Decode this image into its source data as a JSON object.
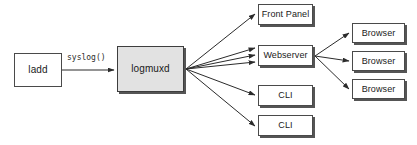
{
  "diagram": {
    "canvas": {
      "width": 417,
      "height": 145,
      "background": "#ffffff"
    },
    "colors": {
      "box_fill": "#ffffff",
      "box_fill_emphasis": "#e2e2e2",
      "box_stroke": "#4a4a4a",
      "shadow": "#555555",
      "edge_stroke": "#2b2b2b",
      "text": "#1a1a1a"
    },
    "nodes": [
      {
        "id": "ladd",
        "label": "ladd",
        "x": 14,
        "y": 53,
        "w": 48,
        "h": 34,
        "font_size": 10,
        "fill": "white",
        "shadow": false
      },
      {
        "id": "logmuxd",
        "label": "logmuxd",
        "x": 117,
        "y": 46,
        "w": 67,
        "h": 46,
        "font_size": 10,
        "fill": "emphasis",
        "shadow": true
      },
      {
        "id": "front-panel",
        "label": "Front Panel",
        "x": 258,
        "y": 4,
        "w": 55,
        "h": 21,
        "font_size": 9,
        "fill": "white",
        "shadow": true
      },
      {
        "id": "webserver",
        "label": "Webserver",
        "x": 258,
        "y": 45,
        "w": 55,
        "h": 21,
        "font_size": 9,
        "fill": "white",
        "shadow": true
      },
      {
        "id": "cli-1",
        "label": "CLI",
        "x": 258,
        "y": 85,
        "w": 55,
        "h": 21,
        "font_size": 9,
        "fill": "white",
        "shadow": true
      },
      {
        "id": "cli-2",
        "label": "CLI",
        "x": 258,
        "y": 115,
        "w": 55,
        "h": 21,
        "font_size": 9,
        "fill": "white",
        "shadow": true
      },
      {
        "id": "browser-1",
        "label": "Browser",
        "x": 352,
        "y": 23,
        "w": 53,
        "h": 20,
        "font_size": 9,
        "fill": "white",
        "shadow": true
      },
      {
        "id": "browser-2",
        "label": "Browser",
        "x": 352,
        "y": 51,
        "w": 53,
        "h": 20,
        "font_size": 9,
        "fill": "white",
        "shadow": true
      },
      {
        "id": "browser-3",
        "label": "Browser",
        "x": 352,
        "y": 79,
        "w": 53,
        "h": 20,
        "font_size": 9,
        "fill": "white",
        "shadow": true
      }
    ],
    "edges": [
      {
        "id": "ladd-to-logmuxd",
        "from": "ladd",
        "to": "logmuxd",
        "label": "syslog()",
        "x1": 62,
        "y1": 70,
        "x2": 114,
        "y2": 70
      },
      {
        "id": "logmuxd-to-front-panel",
        "from": "logmuxd",
        "to": "front-panel",
        "label": "",
        "x1": 186,
        "y1": 69,
        "x2": 255,
        "y2": 14
      },
      {
        "id": "logmuxd-to-webserver-a",
        "from": "logmuxd",
        "to": "webserver",
        "label": "",
        "x1": 186,
        "y1": 69,
        "x2": 255,
        "y2": 48
      },
      {
        "id": "logmuxd-to-webserver-b",
        "from": "logmuxd",
        "to": "webserver",
        "label": "",
        "x1": 186,
        "y1": 69,
        "x2": 255,
        "y2": 55
      },
      {
        "id": "logmuxd-to-webserver-c",
        "from": "logmuxd",
        "to": "webserver",
        "label": "",
        "x1": 186,
        "y1": 69,
        "x2": 255,
        "y2": 62
      },
      {
        "id": "logmuxd-to-cli-1",
        "from": "logmuxd",
        "to": "cli-1",
        "label": "",
        "x1": 186,
        "y1": 69,
        "x2": 255,
        "y2": 95
      },
      {
        "id": "logmuxd-to-cli-2",
        "from": "logmuxd",
        "to": "cli-2",
        "label": "",
        "x1": 186,
        "y1": 69,
        "x2": 255,
        "y2": 126
      },
      {
        "id": "webserver-to-browser-1",
        "from": "webserver",
        "to": "browser-1",
        "label": "",
        "x1": 315,
        "y1": 56,
        "x2": 349,
        "y2": 33
      },
      {
        "id": "webserver-to-browser-2",
        "from": "webserver",
        "to": "browser-2",
        "label": "",
        "x1": 315,
        "y1": 56,
        "x2": 349,
        "y2": 61
      },
      {
        "id": "webserver-to-browser-3",
        "from": "webserver",
        "to": "browser-3",
        "label": "",
        "x1": 315,
        "y1": 56,
        "x2": 349,
        "y2": 89
      }
    ],
    "edge_labels": [
      {
        "id": "syslog-label",
        "text": "syslog()",
        "x": 67,
        "y": 54,
        "font_size": 8
      }
    ]
  }
}
